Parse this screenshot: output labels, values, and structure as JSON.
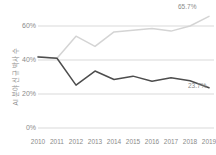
{
  "chart_data": {
    "type": "line",
    "title": "",
    "xlabel": "",
    "ylabel": "AI 분야 신규 박사 수",
    "categories": [
      "2010",
      "2011",
      "2012",
      "2013",
      "2014",
      "2015",
      "2016",
      "2017",
      "2018",
      "2019"
    ],
    "ylim": [
      0,
      70
    ],
    "y_ticks": [
      0,
      20,
      40,
      60
    ],
    "y_tick_labels": [
      "0%",
      "20%",
      "40%",
      "60%"
    ],
    "grid": true,
    "legend": "none",
    "series": [
      {
        "name": "상위 계열",
        "color": "#d4d4d4",
        "values": [
          42.0,
          41.0,
          54.0,
          48.0,
          56.5,
          57.5,
          58.5,
          57.0,
          60.0,
          65.7
        ],
        "end_label": "65.7%"
      },
      {
        "name": "하위 계열",
        "color": "#4d4d4d",
        "values": [
          41.8,
          41.0,
          25.2,
          33.5,
          28.5,
          30.5,
          27.5,
          29.5,
          27.8,
          23.7
        ],
        "end_label": "23.7%"
      }
    ],
    "annotations": [
      {
        "text": "65.7%",
        "position": "top-right"
      },
      {
        "text": "23.7%",
        "position": "bottom-right"
      }
    ]
  },
  "axis": {
    "y_title": "AI 분야 신규 박사 수",
    "y_labels": [
      "60%",
      "40%",
      "20%",
      "0%"
    ],
    "x_labels": [
      "2010",
      "2011",
      "2012",
      "2013",
      "2014",
      "2015",
      "2016",
      "2017",
      "2018",
      "2019"
    ]
  },
  "labels": {
    "high_end": "65.7%",
    "low_end": "23.7%"
  },
  "colors": {
    "series_high": "#d4d4d4",
    "series_low": "#4d4d4d",
    "grid": "#d9d9d9",
    "text": "#8a8a8a",
    "background": "#ffffff"
  }
}
